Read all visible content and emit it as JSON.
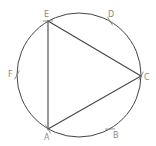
{
  "diagram": {
    "type": "geometry-construction",
    "colors": {
      "stroke": "#444444",
      "label": "#8a8a8a",
      "background": "#ffffff"
    },
    "circle": {
      "cx": 79,
      "cy": 75,
      "r": 62
    },
    "points": [
      {
        "id": "A",
        "label": "A",
        "x": 48,
        "y": 129,
        "lx": 44,
        "ly": 140
      },
      {
        "id": "B",
        "label": "B",
        "x": 110,
        "y": 129,
        "lx": 113,
        "ly": 138
      },
      {
        "id": "C",
        "label": "C",
        "x": 141,
        "y": 76,
        "lx": 144,
        "ly": 80
      },
      {
        "id": "D",
        "label": "D",
        "x": 110,
        "y": 21,
        "lx": 108,
        "ly": 17
      },
      {
        "id": "E",
        "label": "E",
        "x": 48,
        "y": 21,
        "lx": 44,
        "ly": 17
      },
      {
        "id": "F",
        "label": "F",
        "x": 17,
        "y": 75,
        "lx": 8,
        "ly": 77
      }
    ],
    "triangle": [
      "A",
      "C",
      "E"
    ],
    "tick_marks": [
      "B",
      "D",
      "F",
      "E",
      "C",
      "A"
    ]
  }
}
